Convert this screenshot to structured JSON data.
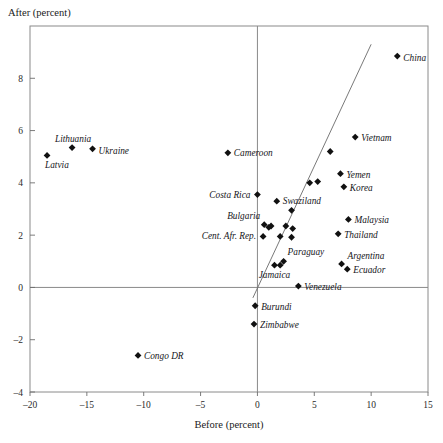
{
  "chart_data": {
    "type": "scatter",
    "title": "",
    "xlabel": "Before (percent)",
    "ylabel": "After (percent)",
    "xlim": [
      -20,
      15
    ],
    "ylim": [
      -4,
      10
    ],
    "xticks": [
      -20,
      -15,
      -10,
      -5,
      0,
      5,
      10,
      15
    ],
    "xticklabels": [
      "–20",
      "–15",
      "–10",
      "–5",
      "0",
      "5",
      "10",
      "15"
    ],
    "yticks": [
      -4,
      -2,
      0,
      2,
      4,
      6,
      8
    ],
    "yticklabels": [
      "–4",
      "–2",
      "0",
      "2",
      "4",
      "6",
      "8"
    ],
    "grid": false,
    "legend": "none",
    "zero_lines": {
      "horizontal_y": 0,
      "vertical_x": 0
    },
    "fit_line": {
      "x0": -0.4,
      "y0": -0.4,
      "x1": 10.0,
      "y1": 9.3
    },
    "points": [
      {
        "label": "Latvia",
        "x": -18.5,
        "y": 5.05,
        "label_dx": -2,
        "label_dy": 13,
        "anchor": "start"
      },
      {
        "label": "Lithuania",
        "x": -16.3,
        "y": 5.35,
        "label_dx": 1,
        "label_dy": -6,
        "anchor": "middle"
      },
      {
        "label": "Ukraine",
        "x": -14.5,
        "y": 5.3,
        "label_dx": 6,
        "label_dy": 5,
        "anchor": "start"
      },
      {
        "label": "Congo DR",
        "x": -10.5,
        "y": -2.6,
        "label_dx": 6,
        "label_dy": 4,
        "anchor": "start"
      },
      {
        "label": "Cameroon",
        "x": -2.6,
        "y": 5.15,
        "label_dx": 6,
        "label_dy": 3,
        "anchor": "start"
      },
      {
        "label": "Costa Rica",
        "x": 0.0,
        "y": 3.55,
        "label_dx": -7,
        "label_dy": 3,
        "anchor": "end"
      },
      {
        "label": "Swaziland",
        "x": 1.7,
        "y": 3.3,
        "label_dx": 6,
        "label_dy": 3,
        "anchor": "start"
      },
      {
        "label": "Bulgaria",
        "x": 0.6,
        "y": 2.4,
        "label_dx": -4,
        "label_dy": -6,
        "anchor": "end"
      },
      {
        "label": "Cent. Afr. Rep.",
        "x": 0.5,
        "y": 1.95,
        "label_dx": -7,
        "label_dy": 3,
        "anchor": "end"
      },
      {
        "label": "Paraguay",
        "x": 2.3,
        "y": 1.0,
        "label_dx": 4,
        "label_dy": -6,
        "anchor": "start"
      },
      {
        "label": "Jamaica",
        "x": 1.5,
        "y": 0.85,
        "label_dx": 0,
        "label_dy": 13,
        "anchor": "middle"
      },
      {
        "label": "Venezuela",
        "x": 3.6,
        "y": 0.05,
        "label_dx": 6,
        "label_dy": 4,
        "anchor": "start"
      },
      {
        "label": "Burundi",
        "x": -0.2,
        "y": -0.7,
        "label_dx": 6,
        "label_dy": 4,
        "anchor": "start"
      },
      {
        "label": "Zimbabwe",
        "x": -0.3,
        "y": -1.4,
        "label_dx": 6,
        "label_dy": 4,
        "anchor": "start"
      },
      {
        "label": "Argentina",
        "x": 7.4,
        "y": 0.9,
        "label_dx": 6,
        "label_dy": -5,
        "anchor": "start"
      },
      {
        "label": "Ecuador",
        "x": 7.9,
        "y": 0.7,
        "label_dx": 6,
        "label_dy": 4,
        "anchor": "start"
      },
      {
        "label": "Thailand",
        "x": 7.1,
        "y": 2.05,
        "label_dx": 6,
        "label_dy": 4,
        "anchor": "start"
      },
      {
        "label": "Malaysia",
        "x": 8.0,
        "y": 2.6,
        "label_dx": 6,
        "label_dy": 4,
        "anchor": "start"
      },
      {
        "label": "Korea",
        "x": 7.6,
        "y": 3.85,
        "label_dx": 6,
        "label_dy": 4,
        "anchor": "start"
      },
      {
        "label": "Yemen",
        "x": 7.3,
        "y": 4.35,
        "label_dx": 6,
        "label_dy": 4,
        "anchor": "start"
      },
      {
        "label": "Vietnam",
        "x": 8.6,
        "y": 5.75,
        "label_dx": 6,
        "label_dy": 4,
        "anchor": "start"
      },
      {
        "label": "China",
        "x": 12.3,
        "y": 8.85,
        "label_dx": 6,
        "label_dy": 5,
        "anchor": "start"
      },
      {
        "label": "",
        "x": 6.4,
        "y": 5.2,
        "label_dx": 0,
        "label_dy": 0,
        "anchor": "start"
      },
      {
        "label": "",
        "x": 4.6,
        "y": 4.0,
        "label_dx": 0,
        "label_dy": 0,
        "anchor": "start"
      },
      {
        "label": "",
        "x": 5.3,
        "y": 4.05,
        "label_dx": 0,
        "label_dy": 0,
        "anchor": "start"
      },
      {
        "label": "",
        "x": 3.0,
        "y": 2.95,
        "label_dx": 0,
        "label_dy": 0,
        "anchor": "start"
      },
      {
        "label": "",
        "x": 2.5,
        "y": 2.35,
        "label_dx": 0,
        "label_dy": 0,
        "anchor": "start"
      },
      {
        "label": "",
        "x": 3.1,
        "y": 2.25,
        "label_dx": 0,
        "label_dy": 0,
        "anchor": "start"
      },
      {
        "label": "",
        "x": 1.2,
        "y": 2.35,
        "label_dx": 0,
        "label_dy": 0,
        "anchor": "start"
      },
      {
        "label": "",
        "x": 1.0,
        "y": 2.3,
        "label_dx": 0,
        "label_dy": 0,
        "anchor": "start"
      },
      {
        "label": "",
        "x": 2.0,
        "y": 1.95,
        "label_dx": 0,
        "label_dy": 0,
        "anchor": "start"
      },
      {
        "label": "",
        "x": 3.0,
        "y": 1.92,
        "label_dx": 0,
        "label_dy": 0,
        "anchor": "start"
      },
      {
        "label": "",
        "x": 2.0,
        "y": 0.85,
        "label_dx": 0,
        "label_dy": 0,
        "anchor": "start"
      }
    ]
  }
}
